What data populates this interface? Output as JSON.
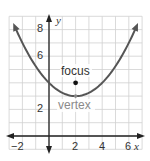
{
  "chart_data": {
    "type": "line",
    "title": "",
    "xlabel": "x",
    "ylabel": "y",
    "xlim": [
      -3,
      7
    ],
    "ylim": [
      -1,
      9
    ],
    "grid": true,
    "x_ticks": [
      -2,
      2,
      4,
      6
    ],
    "y_ticks": [
      2,
      6,
      8
    ],
    "x_tick_labels": [
      "−2",
      "2",
      "4",
      "6"
    ],
    "y_tick_labels": [
      "2",
      "6",
      "8"
    ],
    "series": [
      {
        "name": "parabola",
        "equation": "y = (x - 2)^2 / 4 + 3",
        "x": [
          -3,
          -2,
          -1,
          0,
          1,
          2,
          3,
          4,
          5,
          6,
          7
        ],
        "y": [
          9.25,
          7,
          5.25,
          4,
          3.25,
          3,
          3.25,
          4,
          5.25,
          7,
          9.25
        ]
      }
    ],
    "annotations": [
      {
        "label": "focus",
        "x": 2,
        "y": 4
      },
      {
        "label": "vertex",
        "x": 2,
        "y": 3
      }
    ]
  },
  "labels": {
    "x_axis": "x",
    "y_axis": "y",
    "focus": "focus",
    "vertex": "vertex",
    "tick_x_m2": "−2",
    "tick_x_2": "2",
    "tick_x_4": "4",
    "tick_x_6": "6",
    "tick_y_2": "2",
    "tick_y_6": "6",
    "tick_y_8": "8"
  },
  "colors": {
    "curve": "#555555",
    "grid": "#d0d0d0",
    "axis": "#222222",
    "vertex_label": "#8a8a8a"
  }
}
